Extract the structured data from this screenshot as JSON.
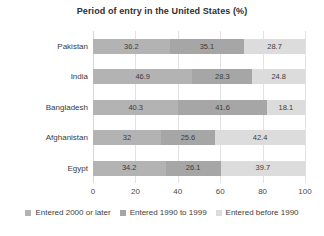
{
  "chart_data": {
    "type": "bar",
    "orientation": "horizontal",
    "stacked": true,
    "title": "Period of entry in the United States (%)",
    "xlabel": "",
    "ylabel": "",
    "xlim": [
      0,
      100
    ],
    "xticks": [
      "0",
      "20",
      "40",
      "60",
      "80",
      "100"
    ],
    "grid": true,
    "legend_position": "bottom",
    "categories": [
      "Pakistan",
      "India",
      "Bangladesh",
      "Afghanistan",
      "Egypt"
    ],
    "series": [
      {
        "name": "Entered 2000 or later",
        "color": "#b3b3b3",
        "values": [
          36.2,
          46.9,
          40.3,
          32,
          34.2
        ],
        "labels": [
          "36.2",
          "46.9",
          "40.3",
          "32",
          "34.2"
        ]
      },
      {
        "name": "Entered 1990 to 1999",
        "color": "#a6a6a6",
        "values": [
          35.1,
          28.3,
          41.6,
          25.6,
          26.1
        ],
        "labels": [
          "35.1",
          "28.3",
          "41.6",
          "25.6",
          "26.1"
        ]
      },
      {
        "name": "Entered before 1990",
        "color": "#dcdcdc",
        "values": [
          28.7,
          24.8,
          18.1,
          42.4,
          39.7
        ],
        "labels": [
          "28.7",
          "24.8",
          "18.1",
          "42.4",
          "39.7"
        ]
      }
    ]
  },
  "colors": {
    "gridline": "#e2e2e2",
    "background": "#ffffff",
    "text": "#3a3a3a"
  }
}
